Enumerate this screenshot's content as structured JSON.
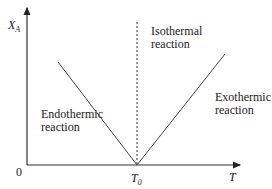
{
  "diagram": {
    "y_axis_label": "X",
    "y_axis_label_sub": "A",
    "x_axis_label": "T",
    "origin_label": "0",
    "vertex_label": "T",
    "vertex_label_sub": "0",
    "regions": {
      "endothermic": [
        "Endothermic",
        "reaction"
      ],
      "isothermal": [
        "Isothermal",
        "reaction"
      ],
      "exothermic": [
        "Exothermic",
        "reaction"
      ]
    },
    "lines": [
      {
        "name": "endothermic-line",
        "style": "solid",
        "from": "high X_A at low T",
        "to": "0 at T0"
      },
      {
        "name": "isothermal-line",
        "style": "dashed",
        "at": "T0"
      },
      {
        "name": "exothermic-line",
        "style": "solid",
        "from": "0 at T0",
        "to": "high X_A at high T"
      }
    ]
  }
}
